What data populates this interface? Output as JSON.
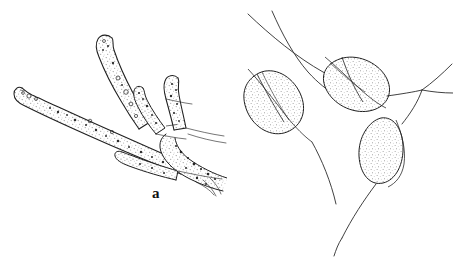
{
  "figure": {
    "kind": "scientific-line-drawing",
    "background_color": "#ffffff",
    "ink_color": "#1a1a1a",
    "stipple_color": "#8a8a8a",
    "width": 453,
    "height": 264,
    "panels": [
      {
        "id": "a",
        "label": "a",
        "label_position": {
          "x": 152,
          "y": 186
        },
        "subject": "branching septate hyphae with stippled cytoplasm, dark granules and small vacuoles",
        "elements": [
          "upper-ascending-hypha-with-rounded-apex",
          "left-long-hypha-with-rounded-apex",
          "short-erect-hypha-branch",
          "lower-short-hypha-lobe",
          "hyphal-junction-cluster",
          "fine-trailing-hyphal-strands"
        ]
      },
      {
        "id": "b",
        "label": "b",
        "label_position": {
          "x": 409,
          "y": 186
        },
        "subject": "lenticular and ovoid stippled bodies borne on slender filaments",
        "elements": [
          "upper-left-filament-pair",
          "left-lenticular-body",
          "upper-right-lenticular-body",
          "lower-ovoid-body",
          "right-branching-filaments",
          "lower-trailing-filament"
        ]
      }
    ]
  },
  "labels": {
    "panel_a": "a",
    "panel_b": "b"
  }
}
